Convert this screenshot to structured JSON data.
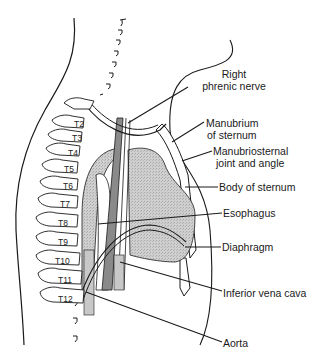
{
  "diagram": {
    "type": "anatomical-sagittal-section",
    "colors": {
      "line": "#1a1a1a",
      "organ_fill": "#c8c8c8",
      "vessel_dark": "#8a8a8a",
      "background": "#ffffff"
    },
    "vertebrae": [
      "T2",
      "T3",
      "T4",
      "T5",
      "T6",
      "T7",
      "T8",
      "T9",
      "T10",
      "T11",
      "T12"
    ],
    "labels": {
      "right_phrenic_nerve_1": "Right",
      "right_phrenic_nerve_2": "phrenic nerve",
      "manubrium_1": "Manubrium",
      "manubrium_2": "of sternum",
      "manubriosternal_1": "Manubriosternal",
      "manubriosternal_2": "joint and angle",
      "body_of_sternum": "Body of sternum",
      "esophagus": "Esophagus",
      "diaphragm": "Diaphragm",
      "inferior_vena_cava": "Inferior vena cava",
      "aorta": "Aorta"
    }
  }
}
